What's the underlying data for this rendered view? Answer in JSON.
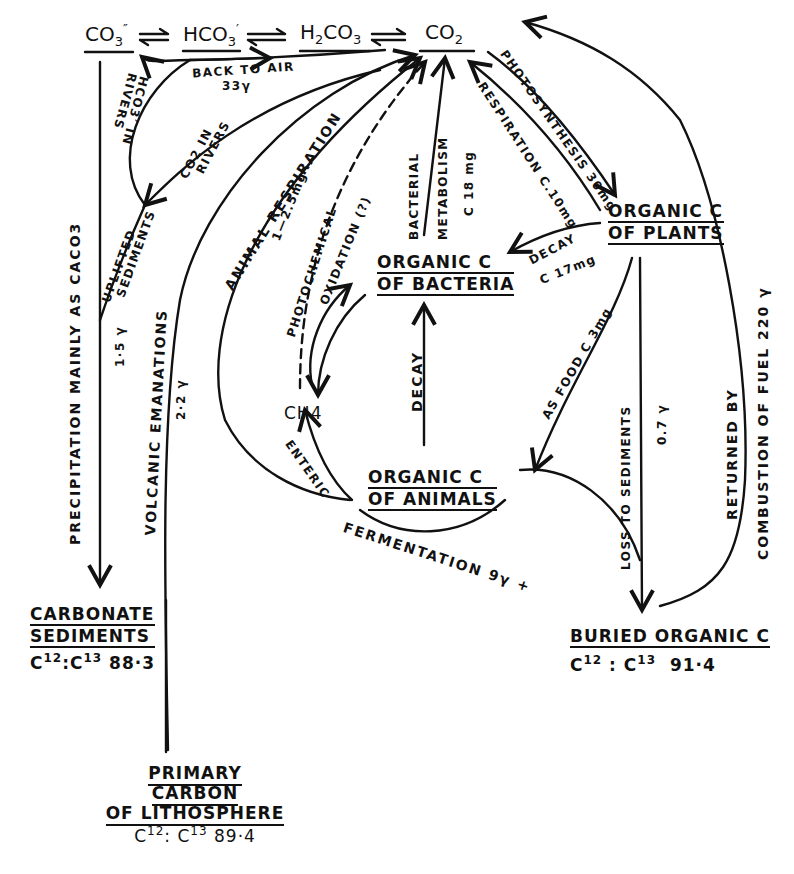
{
  "diagram": {
    "type": "carbon-cycle",
    "species_chain": {
      "carbonate": "CO",
      "carbonate_sub": "3",
      "carbonate_sup": "″",
      "bicarbonate": "HCO",
      "bicarbonate_sub": "3",
      "bicarbonate_sup": "′",
      "carbonic_acid_pre": "H",
      "carbonic_acid_sub1": "2",
      "carbonic_acid_mid": "CO",
      "carbonic_acid_sub2": "3",
      "co2": "CO",
      "co2_sub": "2",
      "equilibrium_symbol": "⇌"
    },
    "nodes": {
      "organic_plants": [
        "ORGANIC C",
        "OF PLANTS"
      ],
      "organic_bacteria": [
        "ORGANIC C",
        "OF BACTERIA"
      ],
      "organic_animals": [
        "ORGANIC C",
        "OF ANIMALS"
      ],
      "methane": "CH4",
      "carbonate_sediments": [
        "CARBONATE",
        "SEDIMENTS"
      ],
      "carbonate_ratio": {
        "c12": "C",
        "sup12": "12",
        "sep": ":",
        "c13": "C",
        "sup13": "13",
        "value": "88·3"
      },
      "buried_organic": "BURIED ORGANIC C",
      "buried_ratio": {
        "c12": "C",
        "sup12": "12",
        "sep": ":",
        "c13": "C",
        "sup13": "13",
        "value": "91·4"
      },
      "primary_carbon": [
        "PRIMARY",
        "CARBON",
        "OF LITHOSPHERE"
      ],
      "primary_ratio": {
        "c12": "C",
        "sup12": "12",
        "sep": ":",
        "c13": "C",
        "sup13": "13",
        "value": "89·4"
      }
    },
    "flows": {
      "back_to_air": "BACK TO AIR",
      "back_to_air_value": "33γ",
      "hco3_in_rivers": [
        "HCO3′ IN",
        "RIVERS"
      ],
      "co2_in_rivers": [
        "CO2 IN",
        "RIVERS"
      ],
      "uplifted_sediments": [
        "UPLIFTED",
        "SEDIMENTS"
      ],
      "uplifted_value": "1·5 γ",
      "precipitation": "PRECIPITATION MAINLY AS CACO3",
      "volcanic": "VOLCANIC EMANATIONS",
      "volcanic_value": "2·2 γ",
      "animal_respiration": "ANIMAL RESPIRATION",
      "animal_respiration_value": "1—2.5mg",
      "photochemical": "PHOTOCHEMICAL",
      "oxidation": "OXIDATION (?)",
      "bacterial": "BACTERIAL",
      "metabolism": "METABOLISM",
      "bacterial_value": "C 18 mg",
      "respiration": "RESPIRATION C.10mg",
      "photosynthesis": "PHOTOSYNTHESIS 30mg",
      "decay_plants": "DECAY",
      "decay_plants_value": "C 17mg",
      "as_food": "AS FOOD C 3mg",
      "decay_animals": "DECAY",
      "enteric": "ENTERIC",
      "fermentation": "FERMENTATION 9γ +",
      "loss_to_sediments": "LOSS TO SEDIMENTS",
      "loss_value": "0.7 γ",
      "returned_by": "RETURNED BY",
      "combustion": "COMBUSTION OF FUEL  220 γ"
    }
  }
}
